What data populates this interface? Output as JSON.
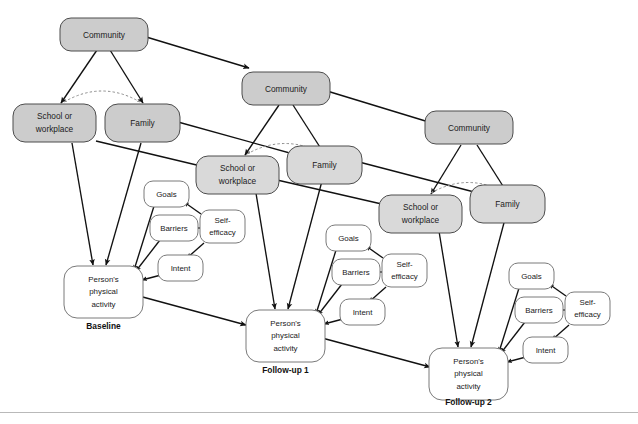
{
  "figure": {
    "type": "path-diagram",
    "background_color": "#ffffff",
    "node_fill_environment": "#cccccc",
    "node_fill_environment_mid": "#d9d9d9",
    "node_fill_cognitive": "#ffffff",
    "edge_color": "#111111",
    "dashed_arc_color": "#8c8c8c"
  },
  "wave_labels": [
    {
      "id": "baseline",
      "label": "Baseline"
    },
    {
      "id": "followup1",
      "label": "Follow-up 1"
    },
    {
      "id": "followup2",
      "label": "Follow-up 2"
    }
  ],
  "waves": [
    {
      "id": "baseline",
      "label": "Baseline",
      "nodes": [
        {
          "id": "community-1",
          "name": "community",
          "label": "Community",
          "kind": "environment"
        },
        {
          "id": "school-1",
          "name": "school-or-workplace",
          "label": "School or workplace",
          "line1": "School or",
          "line2": "workplace",
          "kind": "environment"
        },
        {
          "id": "family-1",
          "name": "family",
          "label": "Family",
          "kind": "environment"
        },
        {
          "id": "goals-1",
          "name": "goals",
          "label": "Goals",
          "kind": "cognitive"
        },
        {
          "id": "barriers-1",
          "name": "barriers",
          "label": "Barriers",
          "kind": "cognitive"
        },
        {
          "id": "selfefficacy-1",
          "name": "self-efficacy",
          "label": "Self-efficacy",
          "line1": "Self-",
          "line2": "efficacy",
          "kind": "cognitive"
        },
        {
          "id": "intent-1",
          "name": "intent",
          "label": "Intent",
          "kind": "cognitive"
        },
        {
          "id": "activity-1",
          "name": "persons-physical-activity",
          "label": "Person's physical activity",
          "line1": "Person's",
          "line2": "physical",
          "line3": "activity",
          "kind": "outcome"
        }
      ]
    },
    {
      "id": "followup1",
      "label": "Follow-up 1",
      "nodes": [
        {
          "id": "community-2",
          "name": "community",
          "label": "Community",
          "kind": "environment"
        },
        {
          "id": "school-2",
          "name": "school-or-workplace",
          "label": "School or workplace",
          "line1": "School or",
          "line2": "workplace",
          "kind": "environment"
        },
        {
          "id": "family-2",
          "name": "family",
          "label": "Family",
          "kind": "environment"
        },
        {
          "id": "goals-2",
          "name": "goals",
          "label": "Goals",
          "kind": "cognitive"
        },
        {
          "id": "barriers-2",
          "name": "barriers",
          "label": "Barriers",
          "kind": "cognitive"
        },
        {
          "id": "selfefficacy-2",
          "name": "self-efficacy",
          "label": "Self-efficacy",
          "line1": "Self-",
          "line2": "efficacy",
          "kind": "cognitive"
        },
        {
          "id": "intent-2",
          "name": "intent",
          "label": "Intent",
          "kind": "cognitive"
        },
        {
          "id": "activity-2",
          "name": "persons-physical-activity",
          "label": "Person's physical activity",
          "line1": "Person's",
          "line2": "physical",
          "line3": "activity",
          "kind": "outcome"
        }
      ]
    },
    {
      "id": "followup2",
      "label": "Follow-up 2",
      "nodes": [
        {
          "id": "community-3",
          "name": "community",
          "label": "Community",
          "kind": "environment"
        },
        {
          "id": "school-3",
          "name": "school-or-workplace",
          "label": "School or workplace",
          "line1": "School or",
          "line2": "workplace",
          "kind": "environment"
        },
        {
          "id": "family-3",
          "name": "family",
          "label": "Family",
          "kind": "environment"
        },
        {
          "id": "goals-3",
          "name": "goals",
          "label": "Goals",
          "kind": "cognitive"
        },
        {
          "id": "barriers-3",
          "name": "barriers",
          "label": "Barriers",
          "kind": "cognitive"
        },
        {
          "id": "selfefficacy-3",
          "name": "self-efficacy",
          "label": "Self-efficacy",
          "line1": "Self-",
          "line2": "efficacy",
          "kind": "cognitive"
        },
        {
          "id": "intent-3",
          "name": "intent",
          "label": "Intent",
          "kind": "cognitive"
        },
        {
          "id": "activity-3",
          "name": "persons-physical-activity",
          "label": "Person's physical activity",
          "line1": "Person's",
          "line2": "physical",
          "line3": "activity",
          "kind": "outcome"
        }
      ]
    }
  ],
  "node_labels": {
    "community": "Community",
    "school_line1": "School or",
    "school_line2": "workplace",
    "family": "Family",
    "goals": "Goals",
    "barriers": "Barriers",
    "self_efficacy_line1": "Self-",
    "self_efficacy_line2": "efficacy",
    "intent": "Intent",
    "activity_line1": "Person's",
    "activity_line2": "physical",
    "activity_line3": "activity"
  },
  "edges": {
    "within_wave": [
      "community -> school or workplace",
      "community -> family",
      "school or workplace <-> family (dashed curve)",
      "school or workplace -> person's physical activity",
      "family -> person's physical activity",
      "self-efficacy -> goals",
      "self-efficacy -> barriers",
      "self-efficacy -> intent",
      "goals -> person's physical activity",
      "barriers -> person's physical activity",
      "intent -> person's physical activity"
    ],
    "across_waves": [
      "community (baseline) -> community (follow-up 1)",
      "community (follow-up 1) -> community (follow-up 2)",
      "school or workplace (baseline) -> school or workplace (follow-up 1)",
      "family (baseline) -> family (follow-up 1)",
      "school or workplace (follow-up 1) -> school or workplace (follow-up 2)",
      "family (follow-up 1) -> family (follow-up 2)",
      "person's physical activity (baseline) -> person's physical activity (follow-up 1)",
      "person's physical activity (follow-up 1) -> person's physical activity (follow-up 2)"
    ]
  }
}
